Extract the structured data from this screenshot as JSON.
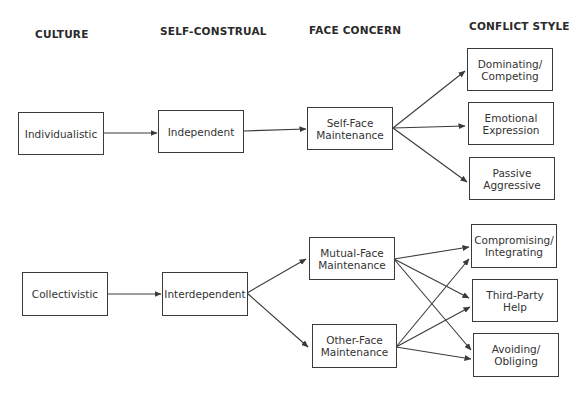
{
  "headers": {
    "culture": "CULTURE",
    "self_construal": "SELF-CONSTRUAL",
    "face_concern": "FACE CONCERN",
    "conflict_style": "CONFLICT STYLE"
  },
  "nodes": {
    "individualistic": {
      "line1": "Individualistic",
      "line2": ""
    },
    "independent": {
      "line1": "Independent",
      "line2": ""
    },
    "self_face": {
      "line1": "Self-Face",
      "line2": "Maintenance"
    },
    "dominating": {
      "line1": "Dominating/",
      "line2": "Competing"
    },
    "emotional": {
      "line1": "Emotional",
      "line2": "Expression"
    },
    "passive": {
      "line1": "Passive",
      "line2": "Aggressive"
    },
    "collectivistic": {
      "line1": "Collectivistic",
      "line2": ""
    },
    "interdependent": {
      "line1": "Interdependent",
      "line2": ""
    },
    "mutual_face": {
      "line1": "Mutual-Face",
      "line2": "Maintenance"
    },
    "other_face": {
      "line1": "Other-Face",
      "line2": "Maintenance"
    },
    "compromising": {
      "line1": "Compromising/",
      "line2": "Integrating"
    },
    "third_party": {
      "line1": "Third-Party",
      "line2": "Help"
    },
    "avoiding": {
      "line1": "Avoiding/",
      "line2": "Obliging"
    }
  },
  "edges": [
    {
      "from": "Individualistic",
      "to": "Independent"
    },
    {
      "from": "Independent",
      "to": "Self-Face Maintenance"
    },
    {
      "from": "Self-Face Maintenance",
      "to": "Dominating/Competing"
    },
    {
      "from": "Self-Face Maintenance",
      "to": "Emotional Expression"
    },
    {
      "from": "Self-Face Maintenance",
      "to": "Passive Aggressive"
    },
    {
      "from": "Collectivistic",
      "to": "Interdependent"
    },
    {
      "from": "Interdependent",
      "to": "Mutual-Face Maintenance"
    },
    {
      "from": "Interdependent",
      "to": "Other-Face Maintenance"
    },
    {
      "from": "Mutual-Face Maintenance",
      "to": "Compromising/Integrating"
    },
    {
      "from": "Mutual-Face Maintenance",
      "to": "Third-Party Help"
    },
    {
      "from": "Mutual-Face Maintenance",
      "to": "Avoiding/Obliging"
    },
    {
      "from": "Other-Face Maintenance",
      "to": "Compromising/Integrating"
    },
    {
      "from": "Other-Face Maintenance",
      "to": "Third-Party Help"
    },
    {
      "from": "Other-Face Maintenance",
      "to": "Avoiding/Obliging"
    }
  ]
}
